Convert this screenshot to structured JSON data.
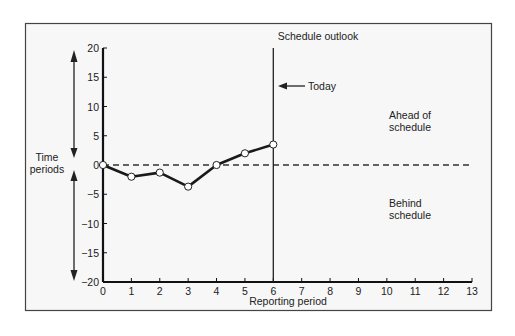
{
  "chart_data": {
    "type": "line",
    "title": "Schedule outlook",
    "xlabel": "Reporting period",
    "ylabel": "Time periods",
    "x": [
      0,
      1,
      2,
      3,
      4,
      5,
      6
    ],
    "series": [
      {
        "name": "Schedule variance",
        "values": [
          0,
          -2,
          -1.3,
          -3.7,
          0,
          2,
          3.5
        ]
      }
    ],
    "xlim": [
      0,
      13
    ],
    "ylim": [
      -20,
      20
    ],
    "xticks": [
      "0",
      "1",
      "2",
      "3",
      "4",
      "5",
      "6",
      "7",
      "8",
      "9",
      "10",
      "11",
      "12",
      "13"
    ],
    "yticks": [
      "20",
      "15",
      "10",
      "5",
      "0",
      "-5",
      "-10",
      "-15",
      "-20"
    ],
    "grid": false,
    "baseline": {
      "y": 0,
      "style": "dashed"
    },
    "annotations": {
      "today_line_x": 6,
      "today_label": "Today",
      "ahead_label": [
        "Ahead of",
        "schedule"
      ],
      "behind_label": [
        "Behind",
        "schedule"
      ]
    },
    "colors": {
      "line": "#1a1a1a",
      "frame": "#444444",
      "background": "#f7f7f7"
    }
  }
}
